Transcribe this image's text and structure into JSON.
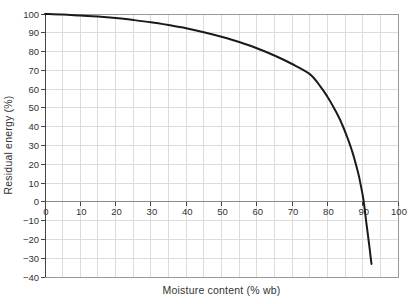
{
  "figure": {
    "background": "#ffffff"
  },
  "chart_data": {
    "type": "line",
    "title": "",
    "xlabel": "Moisture content (% wb)",
    "ylabel": "Residual energy (%)",
    "xlim": [
      0,
      100
    ],
    "ylim": [
      -40,
      100
    ],
    "x_ticks": [
      0,
      10,
      20,
      30,
      40,
      50,
      60,
      70,
      80,
      90,
      100
    ],
    "y_ticks": [
      100,
      90,
      80,
      70,
      60,
      50,
      40,
      30,
      20,
      10,
      0,
      -10,
      -20,
      -30,
      -40
    ],
    "grid": {
      "vertical_step": 5,
      "horizontal_step": 10,
      "color": "#dcdcdc",
      "on": true
    },
    "legend": "none",
    "colors": {
      "curve": "#1a1a1a",
      "y_axis": "#444444",
      "x_axis": "#8a8a8a",
      "tick": "#444444",
      "border": "#999999"
    },
    "curve_width": 2,
    "series": [
      {
        "name": "residual-energy-curve",
        "points": [
          [
            0,
            100
          ],
          [
            5,
            99.7
          ],
          [
            10,
            99.2
          ],
          [
            15,
            98.6
          ],
          [
            20,
            97.8
          ],
          [
            25,
            96.8
          ],
          [
            30,
            95.6
          ],
          [
            35,
            94.1
          ],
          [
            40,
            92.4
          ],
          [
            45,
            90.3
          ],
          [
            50,
            87.9
          ],
          [
            55,
            85.1
          ],
          [
            60,
            81.8
          ],
          [
            65,
            77.9
          ],
          [
            70,
            73.4
          ],
          [
            75,
            68.0
          ],
          [
            78,
            61.5
          ],
          [
            80,
            56.0
          ],
          [
            82,
            49.5
          ],
          [
            84,
            42.0
          ],
          [
            86,
            32.5
          ],
          [
            87,
            27.0
          ],
          [
            88,
            20.5
          ],
          [
            89,
            13.0
          ],
          [
            90,
            3.5
          ],
          [
            90.5,
            -3.0
          ],
          [
            91,
            -10.5
          ],
          [
            91.5,
            -18.0
          ],
          [
            92,
            -25.5
          ],
          [
            92.5,
            -33.0
          ]
        ]
      }
    ]
  }
}
